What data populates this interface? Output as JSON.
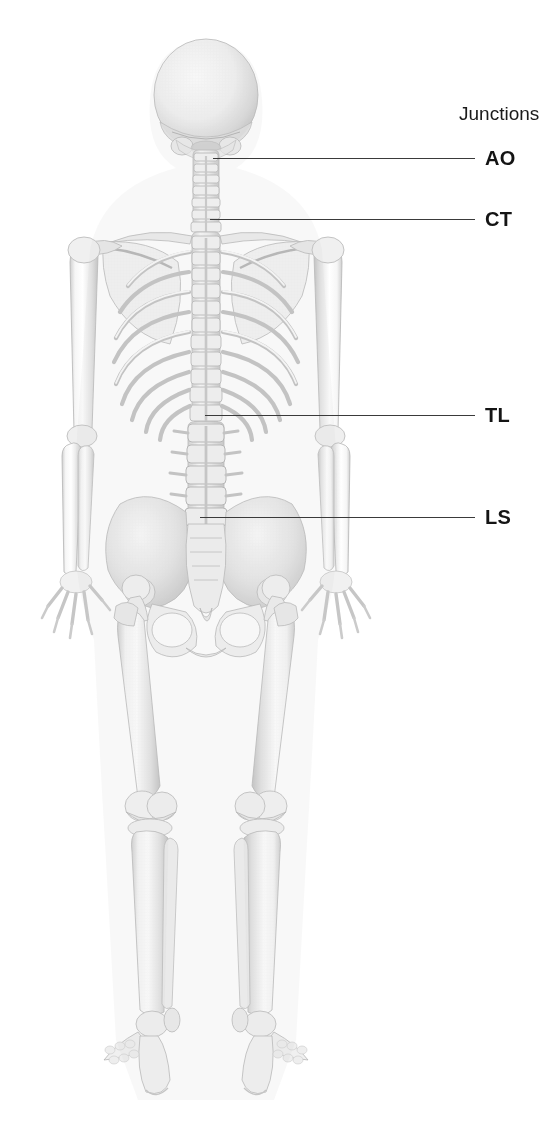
{
  "figure": {
    "kind": "anatomical-illustration",
    "view": "posterior",
    "background_color": "#ffffff",
    "bone_color": "#f2f2f2",
    "bone_shade_color": "#b9b9b9",
    "line_color": "#3a3a3a",
    "label_color": "#141414",
    "width": 556,
    "height": 1144
  },
  "legend": {
    "title": "Junctions"
  },
  "junctions": [
    {
      "abbr": "AO",
      "label_x": 485,
      "label_y": 158,
      "line_x": 213,
      "line_y": 158,
      "line_width": 262
    },
    {
      "abbr": "CT",
      "label_x": 485,
      "label_y": 219,
      "line_x": 210,
      "line_y": 219,
      "line_width": 265
    },
    {
      "abbr": "TL",
      "label_x": 485,
      "label_y": 415,
      "line_x": 205,
      "line_y": 415,
      "line_width": 270
    },
    {
      "abbr": "LS",
      "label_x": 485,
      "label_y": 517,
      "line_x": 200,
      "line_y": 517,
      "line_width": 275
    }
  ]
}
